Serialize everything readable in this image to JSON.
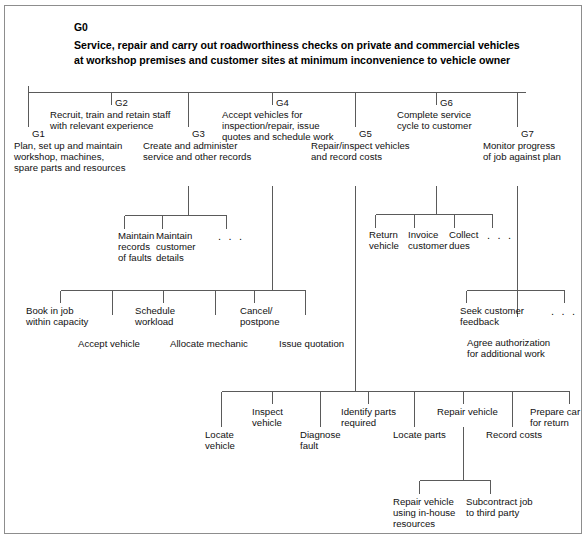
{
  "diagram": {
    "type": "hierarchical-task-analysis",
    "frame_border_color": "#8d8d8d",
    "line_color": "#5a5a5a",
    "background": "#ffffff",
    "text_color": "#111111"
  },
  "goal": {
    "id": "G0",
    "line1": "Service, repair and carry out roadworthiness checks on private and commercial vehicles",
    "line2": "at workshop premises and customer sites at minimum inconvenience to vehicle owner"
  },
  "level1": [
    {
      "id": "G1",
      "line1": "Plan, set up and maintain",
      "line2": "workshop, machines,",
      "line3": "spare parts and resources"
    },
    {
      "id": "G2",
      "line1": "Recruit, train and retain staff",
      "line2": "with relevant experience",
      "line3": ""
    },
    {
      "id": "G3",
      "line1": "Create and administer",
      "line2": "service and other records",
      "line3": ""
    },
    {
      "id": "G4",
      "line1": "Accept vehicles for",
      "line2": "inspection/repair, issue",
      "line3": "quotes and schedule work"
    },
    {
      "id": "G5",
      "line1": "Repair/inspect vehicles",
      "line2": "and record costs",
      "line3": ""
    },
    {
      "id": "G6",
      "line1": "Complete service",
      "line2": "cycle to customer",
      "line3": ""
    },
    {
      "id": "G7",
      "line1": "Monitor progress",
      "line2": "of job against plan",
      "line3": ""
    }
  ],
  "g3_children": [
    {
      "line1": "Maintain",
      "line2": "records",
      "line3": "of faults"
    },
    {
      "line1": "Maintain",
      "line2": "customer",
      "line3": "details"
    }
  ],
  "g3_ellipsis": ". . .",
  "g6_children": [
    {
      "line1": "Return",
      "line2": "vehicle"
    },
    {
      "line1": "Invoice",
      "line2": "customer"
    },
    {
      "line1": "Collect",
      "line2": "dues"
    }
  ],
  "g6_ellipsis": ". . .",
  "g4_children": [
    {
      "line1": "Book in job",
      "line2": "within capacity"
    },
    {
      "line1": "Accept vehicle",
      "line2": ""
    },
    {
      "line1": "Schedule",
      "line2": "workload"
    },
    {
      "line1": "Allocate mechanic",
      "line2": ""
    },
    {
      "line1": "Cancel/",
      "line2": "postpone"
    },
    {
      "line1": "Issue quotation",
      "line2": ""
    }
  ],
  "g7_children": [
    {
      "line1": "Seek customer",
      "line2": "feedback"
    },
    {
      "line1": "Agree authorization",
      "line2": "for additional work"
    }
  ],
  "g7_ellipsis": ". . .",
  "g5_children": [
    {
      "line1": "Locate",
      "line2": "vehicle"
    },
    {
      "line1": "Inspect",
      "line2": "vehicle"
    },
    {
      "line1": "Diagnose",
      "line2": "fault"
    },
    {
      "line1": "Identify parts",
      "line2": "required"
    },
    {
      "line1": "Locate parts",
      "line2": ""
    },
    {
      "line1": "Repair vehicle",
      "line2": ""
    },
    {
      "line1": "Record costs",
      "line2": ""
    },
    {
      "line1": "Prepare car",
      "line2": "for return"
    }
  ],
  "repair_children": [
    {
      "line1": "Repair vehicle",
      "line2": "using in-house",
      "line3": "resources"
    },
    {
      "line1": "Subcontract job",
      "line2": "to third party",
      "line3": ""
    }
  ]
}
